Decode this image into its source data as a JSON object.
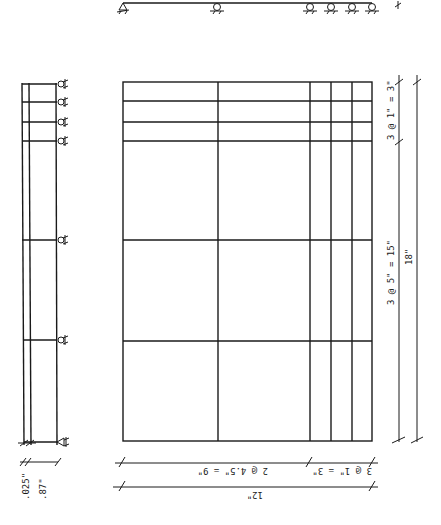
{
  "diagram": {
    "type": "structural-plate-drawing",
    "top_beam": {
      "supports": [
        "pin-support",
        "roller-support",
        "roller-support",
        "roller-support",
        "roller-support",
        "roller-support"
      ],
      "end_mark": "tick"
    },
    "side_section": {
      "supports_count": 7,
      "dims": {
        "thickness_label": ".025\"",
        "width_label": ".87\""
      }
    },
    "plate_grid": {
      "column_dims": {
        "left_label": "2 @ 4.5\" = 9\"",
        "right_label": "3 @ 1\" = 3\"",
        "total_label": "12\""
      },
      "row_dims": {
        "top_label": "3 @ 1\" = 3\"",
        "lower_label": "3 @ 5\" = 15\"",
        "total_label": "18\""
      }
    }
  },
  "colors": {
    "line": "#1a1a1a",
    "background": "#ffffff"
  }
}
